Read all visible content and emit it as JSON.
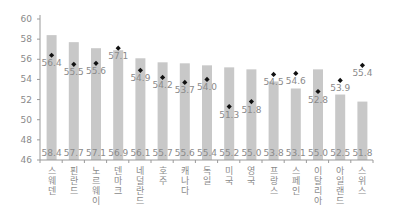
{
  "chart_data": {
    "type": "bar",
    "title": "",
    "xlabel": "",
    "ylabel": "",
    "ylim": [
      46,
      60
    ],
    "yticks": [
      46,
      48,
      50,
      52,
      54,
      56,
      58,
      60
    ],
    "grid": false,
    "legend": null,
    "categories": [
      "스웨덴",
      "핀란드",
      "노르웨이",
      "덴마크",
      "네덜란드",
      "호주",
      "캐나다",
      "독일",
      "미국",
      "영국",
      "프랑스",
      "스페인",
      "이탈리아",
      "아일랜드",
      "스위스"
    ],
    "series": [
      {
        "name": "bar",
        "type": "bar",
        "color": "#c8c8c8",
        "values": [
          58.4,
          57.7,
          57.1,
          56.9,
          56.1,
          55.7,
          55.6,
          55.4,
          55.2,
          55.0,
          53.8,
          53.1,
          55.0,
          52.5,
          51.8
        ]
      },
      {
        "name": "point",
        "type": "scatter",
        "marker": "diamond",
        "color": "#111111",
        "values": [
          56.4,
          55.5,
          55.6,
          57.1,
          54.9,
          54.2,
          53.7,
          54.0,
          51.3,
          51.8,
          54.5,
          54.6,
          52.8,
          53.9,
          55.4
        ]
      }
    ]
  }
}
